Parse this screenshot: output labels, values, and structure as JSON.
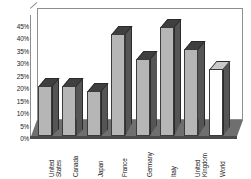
{
  "chart_data": {
    "type": "bar",
    "title": "",
    "subtitle": "",
    "xlabel": "",
    "ylabel": "",
    "categories": [
      "United\nStates",
      "Canada",
      "Japan",
      "France",
      "Germany",
      "Italy",
      "United\nKingdom",
      "World"
    ],
    "values": [
      20,
      20,
      18,
      41,
      31,
      44,
      35,
      27
    ],
    "value_labels": [
      "20%",
      "20%",
      "18%",
      "41%",
      "31%",
      "44%",
      "35%",
      "27%"
    ],
    "ylim": [
      0,
      45
    ],
    "ytick_values": [
      0,
      5,
      10,
      15,
      20,
      25,
      30,
      35,
      40,
      45
    ],
    "ytick_labels": [
      "0%",
      "5%",
      "10%",
      "15%",
      "20%",
      "25%",
      "30%",
      "35%",
      "40%",
      "45%"
    ],
    "grid": false,
    "legend": false,
    "legend_position": "none",
    "style": "3d-column",
    "series": [
      {
        "name": "Share",
        "values": [
          20,
          20,
          18,
          41,
          31,
          44,
          35,
          27
        ]
      }
    ],
    "highlight_category": "World",
    "colors": {
      "bar_face": "#b6b6b6",
      "bar_face_highlight": "#ffffff",
      "bar_side": "#555555",
      "bar_top": "#3f3f3f",
      "bar_outline": "#3b3b3b",
      "floor": "#6f6f6f",
      "frame": "#8d8d8d",
      "background": "#ffffff",
      "text": "#222222"
    }
  }
}
